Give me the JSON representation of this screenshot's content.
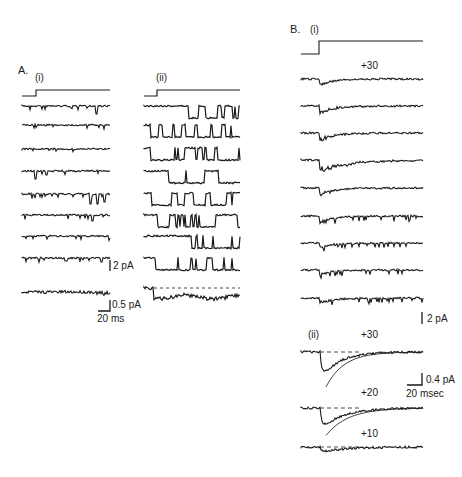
{
  "figure": {
    "panel_a": {
      "label": "A.",
      "sub_i": "(i)",
      "sub_ii": "(ii)",
      "scale_2pa": "2 pA",
      "scale_05pa": "0.5 pA",
      "scale_time": "20 ms"
    },
    "panel_b": {
      "label": "B.",
      "sub_i": "(i)",
      "sub_ii": "(ii)",
      "voltage_i": "+30",
      "scale_2pa": "2 pA",
      "scale_04pa": "0.4 pA",
      "scale_time": "20 msec",
      "voltage_30": "+30",
      "voltage_20": "+20",
      "voltage_10": "+10"
    }
  },
  "traces": {
    "a_i": {
      "x0": 22,
      "x1": 110,
      "step_x": 36,
      "step_low": 96,
      "step_high": 90,
      "baselines": [
        106,
        125,
        149,
        171,
        194,
        215,
        236,
        258
      ],
      "events": [
        [
          0.85,
          8
        ],
        [],
        [],
        [
          0.15,
          8,
          0.28,
          4
        ],
        [
          0.78,
          10,
          0.86,
          10,
          0.94,
          8
        ],
        [
          0.8,
          6
        ],
        [],
        [
          0.5,
          3,
          0.9,
          4
        ]
      ],
      "avg_baseline": 292
    },
    "a_ii": {
      "x0": 144,
      "x1": 240,
      "step_x": 157,
      "step_low": 96,
      "step_high": 90,
      "baselines": [
        106,
        125,
        148,
        171,
        193,
        215,
        236,
        258
      ],
      "open_depth": 12,
      "avg_baseline": 293
    },
    "b_i": {
      "x0": 301,
      "x1": 423,
      "step_x": 319,
      "step_low": 54,
      "step_high": 41,
      "baselines": [
        79,
        106,
        133,
        160,
        188,
        216,
        243,
        270,
        298
      ]
    },
    "b_ii": {
      "x0": 301,
      "x1": 423,
      "onset_x": 320,
      "baselines": [
        352,
        408,
        447
      ],
      "peaks": [
        28,
        22,
        6
      ]
    }
  }
}
